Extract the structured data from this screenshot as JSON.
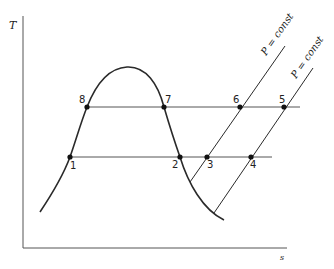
{
  "diagram": {
    "type": "T-s diagram (temperature-entropy) with vapor dome and constant-pressure lines",
    "axes": {
      "y_label": "T",
      "x_label": "s"
    },
    "pressure_lines": [
      {
        "label": "P = const"
      },
      {
        "label": "P = const"
      }
    ],
    "points": [
      {
        "id": "1",
        "label": "1"
      },
      {
        "id": "2",
        "label": "2"
      },
      {
        "id": "3",
        "label": "3"
      },
      {
        "id": "4",
        "label": "4"
      },
      {
        "id": "5",
        "label": "5"
      },
      {
        "id": "6",
        "label": "6"
      },
      {
        "id": "7",
        "label": "7"
      },
      {
        "id": "8",
        "label": "8"
      }
    ],
    "colors": {
      "line": "#2a2a2a",
      "background": "#ffffff"
    }
  }
}
